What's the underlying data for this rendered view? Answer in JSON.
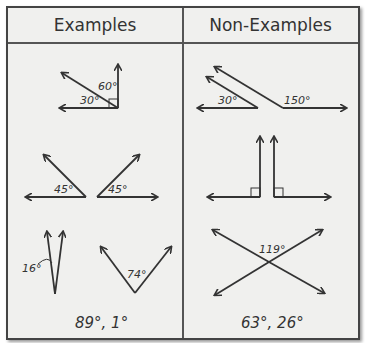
{
  "table": {
    "columns": [
      {
        "header": "Examples"
      },
      {
        "header": "Non-Examples"
      }
    ],
    "examples": {
      "row1": {
        "labels": [
          "60°",
          "30°"
        ]
      },
      "row2": {
        "labels": [
          "45°",
          "45°"
        ]
      },
      "row3": {
        "labels": [
          "16°",
          "74°"
        ]
      },
      "text": "89°, 1°"
    },
    "non_examples": {
      "row1": {
        "labels": [
          "30°",
          "150°"
        ]
      },
      "row2": {
        "labels": []
      },
      "row3": {
        "labels": [
          "119°"
        ]
      },
      "text": "63°, 26°"
    }
  }
}
